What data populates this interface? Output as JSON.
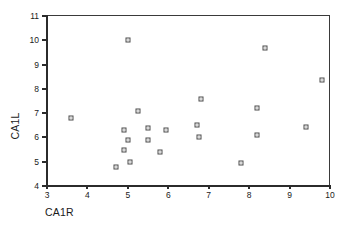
{
  "chart_data": {
    "type": "scatter",
    "title": "",
    "xlabel": "CA1R",
    "ylabel": "CA1L",
    "xlim": [
      3,
      10
    ],
    "ylim": [
      4,
      11
    ],
    "xticks": [
      3,
      4,
      5,
      6,
      7,
      8,
      9,
      10
    ],
    "yticks": [
      4,
      5,
      6,
      7,
      8,
      9,
      10,
      11
    ],
    "grid": false,
    "legend": null,
    "marker": "open-square",
    "marker_color": "#4a4a4a",
    "frame_color": "#3a3a3a",
    "points": [
      {
        "x": 3.6,
        "y": 6.8
      },
      {
        "x": 4.7,
        "y": 4.8
      },
      {
        "x": 4.9,
        "y": 6.3
      },
      {
        "x": 4.9,
        "y": 5.5
      },
      {
        "x": 5.0,
        "y": 10.0
      },
      {
        "x": 5.0,
        "y": 5.9
      },
      {
        "x": 5.05,
        "y": 5.0
      },
      {
        "x": 5.25,
        "y": 7.1
      },
      {
        "x": 5.5,
        "y": 6.4
      },
      {
        "x": 5.5,
        "y": 5.9
      },
      {
        "x": 5.8,
        "y": 5.4
      },
      {
        "x": 5.95,
        "y": 6.3
      },
      {
        "x": 6.7,
        "y": 6.5
      },
      {
        "x": 6.75,
        "y": 6.0
      },
      {
        "x": 6.8,
        "y": 7.6
      },
      {
        "x": 7.8,
        "y": 4.95
      },
      {
        "x": 8.2,
        "y": 7.2
      },
      {
        "x": 8.2,
        "y": 6.1
      },
      {
        "x": 8.4,
        "y": 9.7
      },
      {
        "x": 9.4,
        "y": 6.45
      },
      {
        "x": 9.8,
        "y": 8.35
      }
    ]
  },
  "axis": {
    "x_title": "CA1R",
    "y_title": "CA1L"
  }
}
